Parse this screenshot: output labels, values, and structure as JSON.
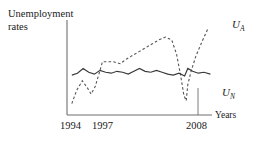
{
  "chart_data": {
    "type": "line",
    "title": "",
    "ylabel": "Unemployment rates",
    "xlabel": "Years",
    "grid": false,
    "legend_position": "right-of-curve-ends",
    "x_ticks": [
      "1994",
      "1997",
      "2008"
    ],
    "x_tick_positions": [
      1994,
      1997,
      2008
    ],
    "xlim": [
      1993,
      2011
    ],
    "ylim": [
      0,
      10
    ],
    "annotations": [
      {
        "name": "vertical-marker-2008",
        "x": 2008,
        "note": "vertical reference line dropped at 2008"
      }
    ],
    "series": [
      {
        "name": "U_A",
        "label": "U",
        "sublabel": "A",
        "style": "dashed",
        "color": "#555555",
        "description": "Actual unemployment rate",
        "x": [
          1993.6,
          1994.2,
          1994.9,
          1995.5,
          1996.0,
          1996.5,
          1997.0,
          1997.4,
          1998.0,
          1998.8,
          1999.6,
          2000.4,
          2001.2,
          2002.0,
          2002.8,
          2003.6,
          2004.4,
          2005.2,
          2006.0,
          2006.6,
          2007.1,
          2007.5,
          2007.8,
          2008.0,
          2008.4,
          2009.0,
          2009.8,
          2010.5
        ],
        "values": [
          1.2,
          2.6,
          3.6,
          2.9,
          2.2,
          3.0,
          4.4,
          5.6,
          5.6,
          5.6,
          5.4,
          5.9,
          6.3,
          6.7,
          7.1,
          7.5,
          7.9,
          8.2,
          7.9,
          6.4,
          4.2,
          2.1,
          1.5,
          3.2,
          4.6,
          6.2,
          7.8,
          9.1
        ]
      },
      {
        "name": "U_N",
        "label": "U",
        "sublabel": "N",
        "style": "solid",
        "color": "#3a3a3a",
        "description": "Natural unemployment rate",
        "x": [
          1993.6,
          1994.3,
          1995.0,
          1995.7,
          1996.4,
          1997.1,
          1997.8,
          1998.5,
          1999.2,
          1999.9,
          2000.6,
          2001.3,
          2002.0,
          2002.7,
          2003.4,
          2004.1,
          2004.8,
          2005.5,
          2006.2,
          2006.9,
          2007.6,
          2008.0,
          2008.6,
          2009.3,
          2010.0,
          2010.8
        ],
        "values": [
          4.2,
          4.4,
          4.9,
          4.5,
          4.3,
          4.7,
          4.5,
          4.4,
          4.6,
          4.5,
          4.3,
          4.6,
          4.9,
          4.6,
          4.5,
          4.7,
          4.5,
          4.3,
          4.2,
          4.4,
          4.1,
          4.9,
          4.6,
          4.4,
          4.5,
          4.3
        ]
      }
    ]
  },
  "axes": {
    "y_axis_label": "Unemployment\nrates",
    "y_axis_label_line1": "Unemployment",
    "y_axis_label_line2": "rates",
    "x_axis_label": "Years"
  },
  "colors": {
    "axis": "#6e6e6e",
    "solid_series": "#3a3a3a",
    "dashed_series": "#6a6a6a",
    "text": "#1a1a1a",
    "background": "#ffffff"
  }
}
